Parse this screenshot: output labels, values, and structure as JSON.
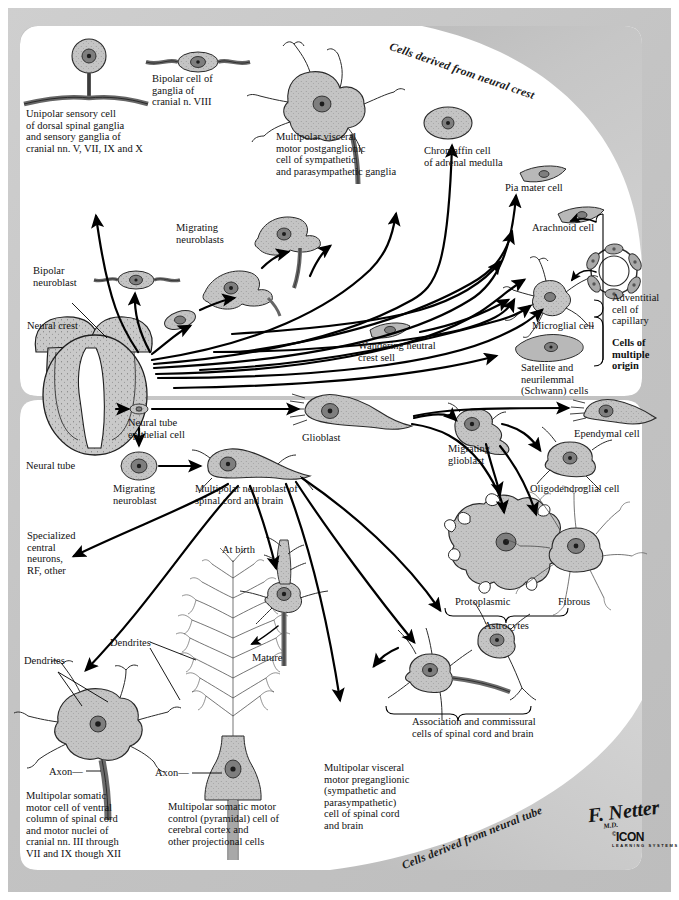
{
  "figure": {
    "banner_top": "Cells derived from neural crest",
    "banner_bottom": "Cells derived from neural tube",
    "signature": "F. Netter",
    "signature_suffix": "M.D.",
    "publisher": "ICON",
    "publisher_mark": "©",
    "publisher_sub": "LEARNING SYSTEMS"
  },
  "neural_crest_panel": {
    "source_label": "Neural crest",
    "labels": [
      {
        "id": "unipolar-sensory-cell",
        "text": "Unipolar sensory cell\nof dorsal spinal ganglia\nand sensory ganglia of\ncranial nn. V, VII, IX and X"
      },
      {
        "id": "bipolar-cell-ganglia-cn8",
        "text": "Bipolar cell of\nganglia of\ncranial n. VIII"
      },
      {
        "id": "multipolar-visceral-motor-postganglionic",
        "text": "Multipolar visceral\nmotor postganglionic\ncell of sympathetic\nand parasympathetic ganglia"
      },
      {
        "id": "chromaffin-cell",
        "text": "Chromaffin cell\nof adrenal medulla"
      },
      {
        "id": "pia-mater-cell",
        "text": "Pia mater cell"
      },
      {
        "id": "arachnoid-cell",
        "text": "Arachnoid cell"
      },
      {
        "id": "migrating-neuroblasts",
        "text": "Migrating\nneuroblasts"
      },
      {
        "id": "bipolar-neuroblast",
        "text": "Bipolar\nneuroblast"
      },
      {
        "id": "wandering-neural-crest-cell",
        "text": "Wandering neutral\ncrest sell"
      },
      {
        "id": "microglial-cell",
        "text": "Microglial cell"
      },
      {
        "id": "satellite-schwann-cells",
        "text": "Satellite and\nneurilemmal\n(Schwann) cells"
      },
      {
        "id": "adventitial-cell-capillary",
        "text": "Adventitial\ncell of\ncapillary"
      },
      {
        "id": "cells-of-multiple-origin",
        "text": "Cells of\nmultiple\norigin"
      }
    ]
  },
  "neural_tube_panel": {
    "source_label": "Neural tube",
    "labels": [
      {
        "id": "neural-tube-epithelial-cell",
        "text": "Neural tube\nepithelial cell"
      },
      {
        "id": "glioblast",
        "text": "Glioblast"
      },
      {
        "id": "migrating-neuroblast",
        "text": "Migrating\nneuroblast"
      },
      {
        "id": "multipolar-neuroblast",
        "text": "Multipolar neuroblast of\nspinal cord and brain"
      },
      {
        "id": "migrating-glioblast",
        "text": "Migrating\nglioblast"
      },
      {
        "id": "ependymal-cell",
        "text": "Ependymal cell"
      },
      {
        "id": "oligodendroglial-cell",
        "text": "Oligodendroglial cell"
      },
      {
        "id": "protoplasmic-astrocyte",
        "text": "Protoplasmic"
      },
      {
        "id": "fibrous-astrocyte",
        "text": "Fibrous"
      },
      {
        "id": "astrocytes",
        "text": "Astrocytes"
      },
      {
        "id": "specialized-central-neurons",
        "text": "Specialized\ncentral\nneurons,\nRF, other"
      },
      {
        "id": "at-birth",
        "text": "At birth"
      },
      {
        "id": "mature",
        "text": "Mature"
      },
      {
        "id": "dendrites-left",
        "text": "Dendrites"
      },
      {
        "id": "dendrites-center",
        "text": "Dendrites"
      },
      {
        "id": "axon-left",
        "text": "Axon—"
      },
      {
        "id": "axon-center",
        "text": "Axon—"
      },
      {
        "id": "association-commissural-cells",
        "text": "Association and commissural\ncells of spinal cord and brain"
      },
      {
        "id": "multipolar-somatic-motor-ventral",
        "text": "Multipolar somatic\nmotor cell of ventral\ncolumn of spinal cord\nand motor nuclei of\ncranial nn. III through\nVII and IX though XII"
      },
      {
        "id": "multipolar-somatic-motor-pyramidal",
        "text": "Multipolar somatic motor\ncontrol (pyramidal) cell of\ncerebral cortex and\nother projectional cells"
      },
      {
        "id": "multipolar-visceral-motor-preganglionic",
        "text": "Multipolar visceral\nmotor preganglionic\n(sympathetic and\nparasympathetic)\ncell of spinal cord\nand brain"
      }
    ]
  },
  "colors": {
    "page_background": "#ffffff",
    "paper": "#c9c9c9",
    "panel": "#ffffff",
    "ink": "#111111",
    "cell_fill": "#bfbfbf",
    "nucleus": "#7e7e7e"
  }
}
